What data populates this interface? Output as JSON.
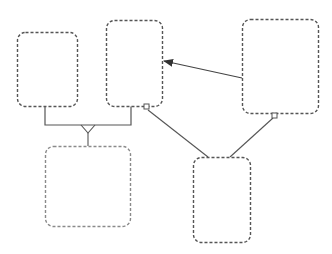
{
  "diagram": {
    "width": 332,
    "height": 254,
    "background": "#ffffff",
    "colors": {
      "box_border": "#555555",
      "box_border_light": "#8a8a8a",
      "connector": "#555555"
    },
    "nodes": [
      {
        "id": "box-1",
        "x": 17,
        "y": 32,
        "w": 60,
        "h": 74,
        "rx": 8,
        "style": "dashed"
      },
      {
        "id": "box-2",
        "x": 106,
        "y": 20,
        "w": 56,
        "h": 86,
        "rx": 8,
        "style": "dashed"
      },
      {
        "id": "box-3",
        "x": 242,
        "y": 19,
        "w": 76,
        "h": 94,
        "rx": 8,
        "style": "dashed"
      },
      {
        "id": "box-4",
        "x": 193,
        "y": 157,
        "w": 57,
        "h": 85,
        "rx": 8,
        "style": "dashed"
      },
      {
        "id": "box-5",
        "x": 45,
        "y": 146,
        "w": 85,
        "h": 80,
        "rx": 8,
        "style": "dashed-light"
      }
    ],
    "edges": [
      {
        "id": "arrow-box3-to-box2",
        "type": "arrow",
        "from": "box-3",
        "to": "box-2",
        "x1": 242,
        "y1": 78,
        "x2": 164,
        "y2": 61
      },
      {
        "id": "bracket-box1-box2",
        "type": "bracket",
        "points": [
          [
            45,
            106
          ],
          [
            45,
            125
          ],
          [
            131,
            125
          ],
          [
            131,
            106
          ]
        ]
      },
      {
        "id": "fork-to-box5",
        "type": "crow-fork",
        "from_y": 125,
        "apex": [
          88,
          133
        ],
        "left": [
          81,
          125
        ],
        "right": [
          95,
          125
        ],
        "end": [
          88,
          146
        ]
      },
      {
        "id": "line-box2-to-box4",
        "type": "line",
        "x1": 148,
        "y1": 110,
        "x2": 208,
        "y2": 157,
        "start_marker": "square",
        "marker_at": [
          146.5,
          106.5
        ]
      },
      {
        "id": "line-box3-to-box4",
        "type": "line",
        "x1": 273,
        "y1": 118,
        "x2": 230,
        "y2": 157,
        "start_marker": "square",
        "marker_at": [
          274.5,
          115.5
        ]
      }
    ]
  }
}
